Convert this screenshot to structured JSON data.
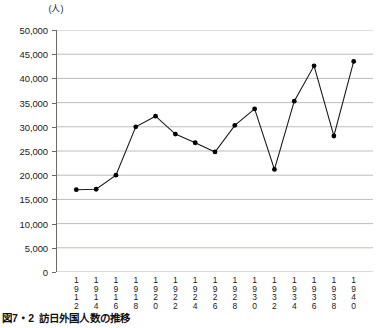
{
  "figure": {
    "caption_number": "図7・2",
    "caption_title": "訪日外国人数の推移",
    "unit_label": "(人)"
  },
  "chart_data": {
    "type": "line",
    "title": "訪日外国人数の推移",
    "subtitle": "",
    "xlabel": "",
    "ylabel": "(人)",
    "unit": "人",
    "grid": true,
    "legend": false,
    "legend_position": "none",
    "xlim": [
      1911,
      1941
    ],
    "ylim": [
      0,
      50000
    ],
    "ytick_interval": 5000,
    "ytick_labels": [
      "0",
      "5,000",
      "10,000",
      "15,000",
      "20,000",
      "25,000",
      "30,000",
      "35,000",
      "40,000",
      "45,000",
      "50,000"
    ],
    "ytick_values": [
      0,
      5000,
      10000,
      15000,
      20000,
      25000,
      30000,
      35000,
      40000,
      45000,
      50000
    ],
    "categories": [
      "1912",
      "1914",
      "1916",
      "1918",
      "1920",
      "1922",
      "1924",
      "1926",
      "1928",
      "1930",
      "1932",
      "1934",
      "1936",
      "1938",
      "1940"
    ],
    "x": [
      1912,
      1914,
      1916,
      1918,
      1920,
      1922,
      1924,
      1926,
      1928,
      1930,
      1932,
      1934,
      1936,
      1938,
      1940
    ],
    "values": [
      17000,
      17100,
      20000,
      30000,
      32200,
      28500,
      26700,
      24800,
      30300,
      33700,
      21200,
      35300,
      42600,
      28100,
      43500
    ],
    "series": [
      {
        "name": "訪日外国人数",
        "values": [
          17000,
          17100,
          20000,
          30000,
          32200,
          28500,
          26700,
          24800,
          30300,
          33700,
          21200,
          35300,
          42600,
          28100,
          43500
        ],
        "color": "#1a1a1a",
        "marker": "circle"
      }
    ]
  },
  "colors": {
    "line": "#1a1a1a",
    "marker": "#000000",
    "grid": "#b9b5ad",
    "axis": "#6e6a63",
    "background": "#ffffff"
  }
}
